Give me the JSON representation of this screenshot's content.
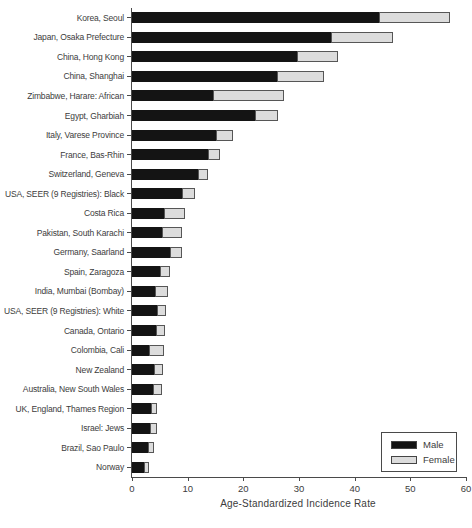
{
  "chart_data": {
    "type": "bar",
    "orientation": "horizontal",
    "stacked": true,
    "title": "",
    "xlabel": "Age-Standardized Incidence Rate",
    "ylabel": "",
    "xlim": [
      0,
      60
    ],
    "xticks": [
      0,
      10,
      20,
      30,
      40,
      50,
      60
    ],
    "grid": false,
    "categories": [
      "Korea, Seoul",
      "Japan, Osaka Prefecture",
      "China, Hong Kong",
      "China, Shanghai",
      "Zimbabwe, Harare: African",
      "Egypt, Gharbiah",
      "Italy, Varese Province",
      "France, Bas-Rhin",
      "Switzerland, Geneva",
      "USA, SEER (9 Registries): Black",
      "Costa Rica",
      "Pakistan, South Karachi",
      "Germany, Saarland",
      "Spain, Zaragoza",
      "India, Mumbai (Bombay)",
      "USA, SEER (9 Registries): White",
      "Canada, Ontario",
      "Colombia, Cali",
      "New Zealand",
      "Australia, New South Wales",
      "UK, England, Thames Region",
      "Israel: Jews",
      "Brazil, Sao Paulo",
      "Norway"
    ],
    "series": [
      {
        "name": "Male",
        "color": "#141414",
        "values": [
          44.6,
          35.9,
          29.8,
          26.2,
          14.7,
          22.3,
          15.2,
          13.8,
          12.0,
          9.2,
          5.9,
          5.6,
          7.0,
          5.2,
          4.3,
          4.7,
          4.4,
          3.2,
          4.2,
          4.0,
          3.5,
          3.4,
          3.0,
          2.3
        ]
      },
      {
        "name": "Female",
        "color": "#dcdcdc",
        "values": [
          12.7,
          11.2,
          7.4,
          8.5,
          12.8,
          4.1,
          3.2,
          2.2,
          1.9,
          2.3,
          3.8,
          3.6,
          2.2,
          1.8,
          2.3,
          1.6,
          1.7,
          2.7,
          1.5,
          1.6,
          1.2,
          1.2,
          1.1,
          0.9
        ]
      }
    ],
    "legend": {
      "position": "bottom-right",
      "entries": [
        {
          "label": "Male",
          "color": "#141414"
        },
        {
          "label": "Female",
          "color": "#dcdcdc"
        }
      ]
    }
  }
}
